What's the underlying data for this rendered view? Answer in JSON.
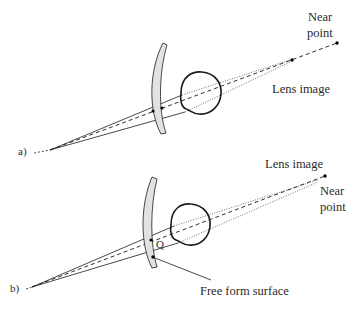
{
  "figure": {
    "panel_a": {
      "label": "a)",
      "near_point_line1": "Near",
      "near_point_line2": "point",
      "lens_image": "Lens image"
    },
    "panel_b": {
      "label": "b)",
      "near_point_line1": "Near",
      "near_point_line2": "point",
      "lens_image": "Lens image",
      "point_q": "Q",
      "free_form": "Free form surface"
    }
  },
  "colors": {
    "stroke": "#1a1a1a",
    "lens_fill": "#e2e2e2",
    "text": "#2a2a2a"
  }
}
